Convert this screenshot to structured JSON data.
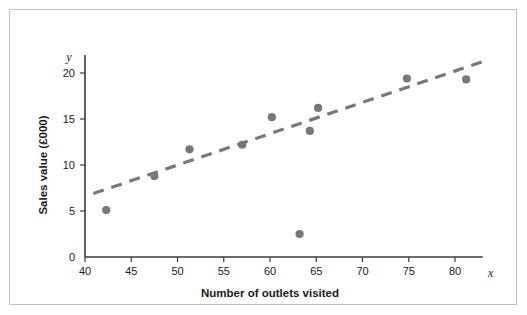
{
  "figure": {
    "border_color": "#bfbfbf",
    "background": "#ffffff"
  },
  "chart_data": {
    "type": "scatter",
    "title": "",
    "xlabel": "Number of outlets visited",
    "ylabel": "Sales value (£000)",
    "x_axis_letter": "x",
    "y_axis_letter": "y",
    "xlim": [
      40,
      83
    ],
    "ylim": [
      0,
      22
    ],
    "xticks": [
      40,
      45,
      50,
      55,
      60,
      65,
      70,
      75,
      80
    ],
    "yticks": [
      0,
      5,
      10,
      15,
      20
    ],
    "xtick_labels": [
      "40",
      "45",
      "50",
      "55",
      "60",
      "65",
      "70",
      "75",
      "80"
    ],
    "ytick_labels": [
      "0",
      "5",
      "10",
      "15",
      "20"
    ],
    "grid": false,
    "legend": "none",
    "marker_color": "#787878",
    "marker_size": 5,
    "points": [
      {
        "x": 42.3,
        "y": 5.1
      },
      {
        "x": 47.5,
        "y": 8.8
      },
      {
        "x": 51.3,
        "y": 11.7
      },
      {
        "x": 57.0,
        "y": 12.2
      },
      {
        "x": 60.2,
        "y": 15.2
      },
      {
        "x": 63.2,
        "y": 2.5
      },
      {
        "x": 64.3,
        "y": 13.7
      },
      {
        "x": 65.2,
        "y": 16.2
      },
      {
        "x": 74.8,
        "y": 19.4
      },
      {
        "x": 81.2,
        "y": 19.3
      }
    ],
    "trendline": {
      "style": "dashed",
      "color": "#787878",
      "x_start": 40.9,
      "y_start": 6.9,
      "x_end": 82.9,
      "y_end": 21.2
    }
  }
}
